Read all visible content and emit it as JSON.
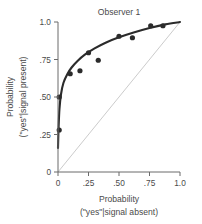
{
  "chart_data": {
    "type": "scatter",
    "title": "Observer 1",
    "xlabel": "Probability",
    "xlabel_line2": "(\"yes\"|signal absent)",
    "ylabel": "Probability",
    "ylabel_line2": "(\"yes\"|signal present)",
    "xlim": [
      0,
      1.0
    ],
    "ylim": [
      0,
      1.0
    ],
    "grid": false,
    "legend": "none",
    "xticks": [
      0,
      0.25,
      0.5,
      0.75,
      1.0
    ],
    "xtick_labels": [
      "0",
      ".25",
      ".50",
      ".75",
      "1.0"
    ],
    "yticks": [
      0,
      0.25,
      0.5,
      0.75,
      1.0
    ],
    "ytick_labels": [
      "0",
      ".25",
      ".50",
      ".75",
      "1.0"
    ],
    "points": [
      {
        "x": 0.01,
        "y": 0.28
      },
      {
        "x": 0.01,
        "y": 0.5
      },
      {
        "x": 0.1,
        "y": 0.655
      },
      {
        "x": 0.18,
        "y": 0.675
      },
      {
        "x": 0.25,
        "y": 0.795
      },
      {
        "x": 0.33,
        "y": 0.745
      },
      {
        "x": 0.5,
        "y": 0.905
      },
      {
        "x": 0.61,
        "y": 0.895
      },
      {
        "x": 0.76,
        "y": 0.975
      },
      {
        "x": 0.86,
        "y": 0.975
      }
    ],
    "fit_curve": [
      {
        "x": 0.0,
        "y": 0.16
      },
      {
        "x": 0.005,
        "y": 0.3
      },
      {
        "x": 0.012,
        "y": 0.42
      },
      {
        "x": 0.025,
        "y": 0.52
      },
      {
        "x": 0.045,
        "y": 0.595
      },
      {
        "x": 0.075,
        "y": 0.65
      },
      {
        "x": 0.11,
        "y": 0.695
      },
      {
        "x": 0.16,
        "y": 0.74
      },
      {
        "x": 0.22,
        "y": 0.782
      },
      {
        "x": 0.3,
        "y": 0.824
      },
      {
        "x": 0.39,
        "y": 0.862
      },
      {
        "x": 0.5,
        "y": 0.898
      },
      {
        "x": 0.62,
        "y": 0.93
      },
      {
        "x": 0.75,
        "y": 0.96
      },
      {
        "x": 0.88,
        "y": 0.984
      },
      {
        "x": 1.0,
        "y": 1.0
      }
    ],
    "reference_line": {
      "from": {
        "x": 0,
        "y": 0
      },
      "to": {
        "x": 1.0,
        "y": 1.0
      },
      "style": "thin-gray-diagonal"
    },
    "colors": {
      "curve": "#2b2b2b",
      "points": "#2b2b2b",
      "axis": "#6b6b6b",
      "reference": "#b9b9b9",
      "text": "#4a4a4a",
      "background": "#ffffff"
    }
  }
}
